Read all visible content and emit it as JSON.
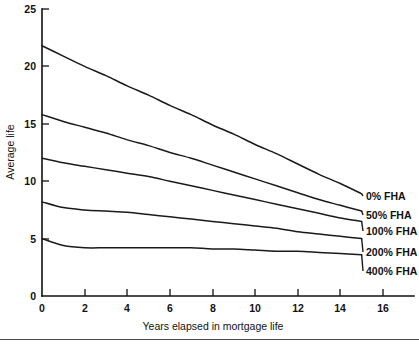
{
  "chart_data": {
    "type": "line",
    "title": "",
    "xlabel": "Years elapsed in mortgage life",
    "ylabel": "Average life",
    "xlim": [
      0,
      17
    ],
    "ylim": [
      0,
      26
    ],
    "xticks": [
      0,
      2,
      4,
      6,
      8,
      10,
      12,
      14,
      16
    ],
    "xtick_labels": [
      "0",
      "2",
      "4",
      "6",
      "8",
      "10",
      "12",
      "14",
      "16"
    ],
    "yticks": [
      0,
      5,
      10,
      15,
      20,
      25
    ],
    "ytick_labels": [
      "0",
      "5",
      "10",
      "15",
      "20",
      "25"
    ],
    "grid": false,
    "legend_position": "right-inline-labels",
    "series": [
      {
        "name": "0% FHA",
        "label": "0% FHA",
        "x": [
          0,
          1,
          2,
          3,
          4,
          5,
          6,
          7,
          8,
          9,
          10,
          11,
          12,
          13,
          14,
          15
        ],
        "values": [
          21.8,
          20.9,
          20.0,
          19.2,
          18.3,
          17.5,
          16.6,
          15.8,
          14.9,
          14.1,
          13.2,
          12.4,
          11.5,
          10.6,
          9.8,
          8.9
        ]
      },
      {
        "name": "50% FHA",
        "label": "50% FHA",
        "x": [
          0,
          1,
          2,
          3,
          4,
          5,
          6,
          7,
          8,
          9,
          10,
          11,
          12,
          13,
          14,
          15
        ],
        "values": [
          15.8,
          15.2,
          14.7,
          14.2,
          13.6,
          13.1,
          12.5,
          12.0,
          11.4,
          10.8,
          10.2,
          9.6,
          9.0,
          8.4,
          7.9,
          7.4
        ]
      },
      {
        "name": "100% FHA",
        "label": "100% FHA",
        "x": [
          0,
          1,
          2,
          3,
          4,
          5,
          6,
          7,
          8,
          9,
          10,
          11,
          12,
          13,
          14,
          15
        ],
        "values": [
          12.0,
          11.6,
          11.3,
          11.0,
          10.7,
          10.4,
          10.0,
          9.6,
          9.2,
          8.8,
          8.4,
          8.0,
          7.6,
          7.2,
          6.8,
          6.5
        ]
      },
      {
        "name": "200% FHA",
        "label": "200% FHA",
        "x": [
          0,
          1,
          2,
          3,
          4,
          5,
          6,
          7,
          8,
          9,
          10,
          11,
          12,
          13,
          14,
          15
        ],
        "values": [
          8.2,
          7.7,
          7.5,
          7.4,
          7.3,
          7.1,
          6.9,
          6.7,
          6.5,
          6.3,
          6.1,
          5.9,
          5.6,
          5.4,
          5.2,
          5.0
        ]
      },
      {
        "name": "400% FHA",
        "label": "400% FHA",
        "x": [
          0,
          1,
          2,
          3,
          4,
          5,
          6,
          7,
          8,
          9,
          10,
          11,
          12,
          13,
          14,
          15
        ],
        "values": [
          5.0,
          4.4,
          4.2,
          4.2,
          4.2,
          4.2,
          4.2,
          4.2,
          4.1,
          4.1,
          4.0,
          3.9,
          3.9,
          3.8,
          3.7,
          3.6
        ]
      }
    ]
  },
  "axis": {
    "y_title": "Average life",
    "x_title": "Years elapsed in mortgage life"
  },
  "series_labels": [
    {
      "text": "0% FHA"
    },
    {
      "text": "50% FHA"
    },
    {
      "text": "100% FHA"
    },
    {
      "text": "200% FHA"
    },
    {
      "text": "400% FHA"
    }
  ],
  "ytick_labels": [
    "25",
    "20",
    "15",
    "10",
    "5",
    "0"
  ],
  "xtick_labels": [
    "0",
    "2",
    "4",
    "6",
    "8",
    "10",
    "12",
    "14",
    "16"
  ],
  "colors": {
    "line": "#1a1a1a",
    "axis": "#111111",
    "background": "#ffffff",
    "footer_rule": "#4a4a4a"
  }
}
